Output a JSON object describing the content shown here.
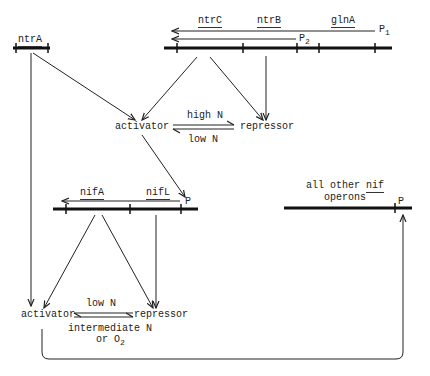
{
  "diagram": {
    "ntrA_operon": {
      "gene": "ntrA"
    },
    "glnA_operon": {
      "genes": [
        "ntrC",
        "ntrB",
        "glnA"
      ],
      "promoter1": "P",
      "promoter1_sub": "1",
      "promoter2": "P",
      "promoter2_sub": "2"
    },
    "ntr_regulation": {
      "activator": "activator",
      "repressor": "repressor",
      "to_repressor_condition": "high N",
      "to_activator_condition": "low N"
    },
    "nifLA_operon": {
      "genes": [
        "nifA",
        "nifL"
      ],
      "promoter": "P"
    },
    "other_nif": {
      "label_line1": "all other",
      "label_nif": "nif",
      "label_line2": "operons",
      "promoter": "P"
    },
    "nif_regulation": {
      "activator": "activator",
      "repressor": "repressor",
      "to_activator_condition": "low N",
      "to_repressor_condition_line1": "intermediate N",
      "to_repressor_condition_line2": "or O",
      "to_repressor_condition_sub": "2"
    }
  }
}
